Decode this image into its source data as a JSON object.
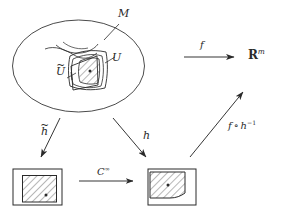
{
  "figure": {
    "kind": "mathematical-diagram",
    "background_color": "#ffffff",
    "ink_color": "#2a2a2a"
  },
  "manifold": {
    "name": "manifold-ellipse",
    "label": "M",
    "label_text": "M",
    "neighborhood_outer": {
      "name": "chart-domain-U",
      "label": "U"
    },
    "neighborhood_inner": {
      "name": "chart-domain-U-tilde",
      "label_base": "U",
      "label_accent": "~",
      "label_text": "Ũ"
    },
    "point_marker": "•"
  },
  "codomain": {
    "name": "euclidean-space",
    "symbol": "R",
    "superscript": "m",
    "label_text": "ℝm"
  },
  "arrows": {
    "f": {
      "name": "arrow-f",
      "label": "f",
      "direction": "right",
      "from": "manifold",
      "to": "euclidean-space"
    },
    "h_tilde": {
      "name": "arrow-h-tilde",
      "label_base": "h",
      "label_accent": "~",
      "label_text": "h̃",
      "direction": "down-right",
      "from": "manifold",
      "to": "chart-square-left"
    },
    "h": {
      "name": "arrow-h",
      "label": "h",
      "direction": "down-right",
      "from": "manifold",
      "to": "chart-square-right"
    },
    "transition": {
      "name": "arrow-transition-map",
      "label_base": "C",
      "label_superscript": "∞",
      "label_text": "C∞",
      "direction": "right",
      "from": "chart-square-left",
      "to": "chart-square-right"
    },
    "f_compose_h_inverse": {
      "name": "arrow-f-compose-h-inverse",
      "label_f": "f",
      "label_circ": "∘",
      "label_h": "h",
      "label_exp": "−1",
      "label_text": "f ∘ h⁻¹",
      "direction": "up-right",
      "from": "chart-square-right",
      "to": "euclidean-space"
    }
  },
  "chart_squares": [
    {
      "name": "chart-square-left",
      "hatched_region": "shifted-right-down",
      "point_marker": "•"
    },
    {
      "name": "chart-square-right",
      "hatched_region": "shifted-left-up",
      "point_marker": "•"
    }
  ]
}
